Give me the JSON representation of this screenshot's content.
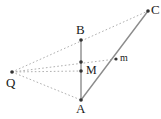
{
  "figure": {
    "canvas": {
      "width": 161,
      "height": 119
    },
    "background_color": "#ffffff",
    "solid_line_color": "#8c8c8c",
    "dotted_line_color": "#b0b0b0",
    "point_color": "#333333",
    "label_color": "#1a1a1a"
  },
  "points": [
    {
      "id": "Q",
      "label": "Q",
      "x": 12,
      "y": 72,
      "label_x": 6,
      "label_y": 76,
      "label_size": 13,
      "dot_r": 1.8,
      "labeled": true
    },
    {
      "id": "B",
      "label": "B",
      "x": 81,
      "y": 40,
      "label_x": 76,
      "label_y": 23,
      "label_size": 13,
      "dot_r": 1.8,
      "labeled": true
    },
    {
      "id": "A",
      "label": "A",
      "x": 81,
      "y": 100,
      "label_x": 76,
      "label_y": 102,
      "label_size": 13,
      "dot_r": 1.8,
      "labeled": true
    },
    {
      "id": "C",
      "label": "C",
      "x": 148,
      "y": 11,
      "label_x": 151,
      "label_y": 3,
      "label_size": 13,
      "dot_r": 1.8,
      "labeled": true
    },
    {
      "id": "M",
      "label": "M",
      "x": 81,
      "y": 71,
      "label_x": 86,
      "label_y": 64,
      "label_size": 12,
      "dot_r": 1.8,
      "labeled": true
    },
    {
      "id": "m",
      "label": "m",
      "x": 116,
      "y": 59,
      "label_x": 120,
      "label_y": 53,
      "label_size": 10,
      "dot_r": 1.6,
      "labeled": true
    },
    {
      "id": "P1",
      "label": "",
      "x": 81,
      "y": 62,
      "label_x": 0,
      "label_y": 0,
      "label_size": 0,
      "dot_r": 1.8,
      "labeled": false
    }
  ],
  "solid_segments": [
    {
      "id": "seg-B-A",
      "from": "B",
      "to": "A",
      "x1": 81,
      "y1": 40,
      "x2": 81,
      "y2": 100,
      "width": 1.4
    },
    {
      "id": "seg-A-C",
      "from": "A",
      "to": "C",
      "x1": 81,
      "y1": 100,
      "x2": 148,
      "y2": 11,
      "width": 1.4
    }
  ],
  "dotted_segments": [
    {
      "id": "seg-Q-B-C",
      "from": "Q",
      "to": "C",
      "x1": 12,
      "y1": 72,
      "x2": 148,
      "y2": 11,
      "width": 1.0
    },
    {
      "id": "seg-Q-P1-m",
      "from": "Q",
      "to": "m",
      "x1": 12,
      "y1": 72,
      "x2": 116,
      "y2": 59,
      "width": 1.0
    },
    {
      "id": "seg-Q-M",
      "from": "Q",
      "to": "M",
      "x1": 12,
      "y1": 72,
      "x2": 81,
      "y2": 71,
      "width": 1.0
    },
    {
      "id": "seg-Q-A",
      "from": "Q",
      "to": "A",
      "x1": 12,
      "y1": 72,
      "x2": 81,
      "y2": 100,
      "width": 1.0
    }
  ]
}
